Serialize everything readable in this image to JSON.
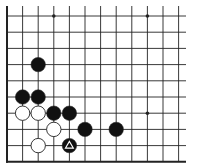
{
  "diagram": {
    "type": "go-board-fragment",
    "colors": {
      "background": "#ffffff",
      "line": "#222222",
      "black_stone": "#111111",
      "white_stone": "#ffffff",
      "stone_outline": "#222222",
      "marker": "#ffffff"
    },
    "grid": {
      "x_lines": [
        7,
        22.6,
        38.2,
        53.8,
        69.4,
        85,
        100.6,
        116.2,
        131.8,
        147.4,
        163,
        178.6
      ],
      "y_lines": [
        16,
        32.2,
        48.4,
        64.6,
        80.8,
        97,
        113.2,
        129.4,
        145.6,
        161.8
      ],
      "left_edge": true,
      "bottom_edge": true,
      "extends_right_to": 186,
      "extends_top_to": 6
    },
    "star_points": [
      {
        "col": 3,
        "row": 0
      },
      {
        "col": 9,
        "row": 0
      },
      {
        "col": 9,
        "row": 6
      }
    ],
    "stones": [
      {
        "color": "black",
        "col": 2,
        "row": 3
      },
      {
        "color": "black",
        "col": 1,
        "row": 5
      },
      {
        "color": "black",
        "col": 2,
        "row": 5
      },
      {
        "color": "white",
        "col": 1,
        "row": 6
      },
      {
        "color": "white",
        "col": 2,
        "row": 6
      },
      {
        "color": "black",
        "col": 3,
        "row": 6
      },
      {
        "color": "black",
        "col": 4,
        "row": 6
      },
      {
        "color": "white",
        "col": 3,
        "row": 7
      },
      {
        "color": "black",
        "col": 5,
        "row": 7
      },
      {
        "color": "black",
        "col": 7,
        "row": 7
      },
      {
        "color": "white",
        "col": 2,
        "row": 8
      },
      {
        "color": "black",
        "col": 4,
        "row": 8,
        "marker": "triangle"
      }
    ]
  }
}
